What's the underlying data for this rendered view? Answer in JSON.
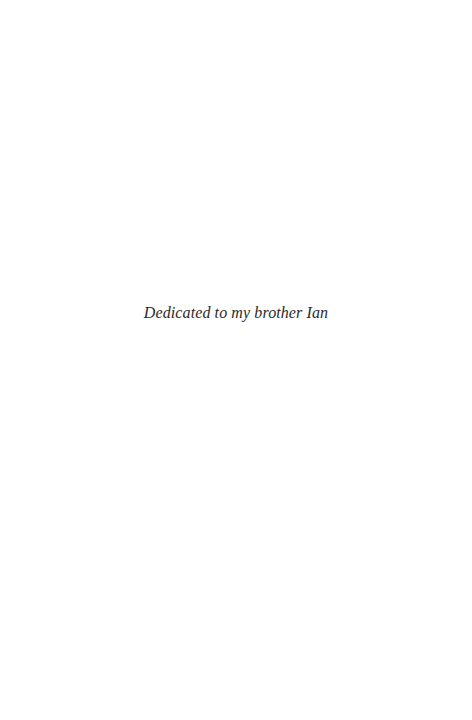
{
  "page": {
    "dedication": "Dedicated to my brother Ian"
  },
  "colors": {
    "background": "#ffffff",
    "text": "#2a2a2a"
  }
}
